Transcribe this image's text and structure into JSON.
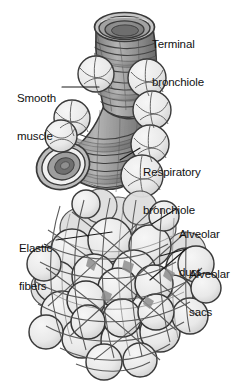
{
  "figure": {
    "type": "anatomical-illustration",
    "background_color": "#ffffff",
    "ink_color": "#3a3a3a",
    "fill_light": "#ededed",
    "fill_mid": "#9a9a9a",
    "fill_dark": "#6a6a6a",
    "lumen_color": "#8d8d8d",
    "width": 252,
    "height": 386
  },
  "labels": [
    {
      "id": "terminal-bronchiole",
      "line1": "Terminal",
      "line2": "bronchiole",
      "x": 152,
      "y": 14,
      "align": "right"
    },
    {
      "id": "smooth-muscle",
      "line1": "Smooth",
      "line2": "muscle",
      "x": 18,
      "y": 68,
      "align": "left"
    },
    {
      "id": "respiratory-bronchiole",
      "line1": "Respiratory",
      "line2": "bronchiole",
      "x": 142,
      "y": 142,
      "align": "right"
    },
    {
      "id": "alveolar-duct",
      "line1": "Alveolar",
      "line2": "duct",
      "x": 178,
      "y": 204,
      "align": "right"
    },
    {
      "id": "elastic-fibers",
      "line1": "Elastic",
      "line2": "fibers",
      "x": 20,
      "y": 218,
      "align": "left"
    },
    {
      "id": "alveolar-sacs",
      "line1": "Alveolar",
      "line2": "sacs",
      "x": 188,
      "y": 244,
      "align": "right"
    }
  ],
  "caption": {
    "text": "",
    "visible": false
  }
}
